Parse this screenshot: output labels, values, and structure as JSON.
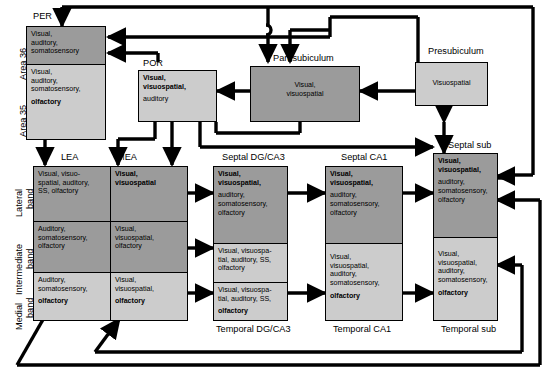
{
  "diagram": {
    "title_regions": {
      "per": "PER",
      "por": "POR",
      "parasubiculum": "Parasubiculum",
      "presubiculum": "Presubiculum",
      "septal_sub": "Septal sub",
      "lea": "LEA",
      "mea": "MEA",
      "septal_dg_ca3": "Septal DG/CA3",
      "septal_ca1": "Septal CA1",
      "temporal_dg_ca3": "Temporal DG/CA3",
      "temporal_ca1": "Temporal CA1",
      "temporal_sub": "Temporal sub"
    },
    "side_labels": {
      "area36": "Area 36",
      "area35": "Area 35",
      "lateral_band": "Lateral\nband",
      "lateral_band_line1": "Lateral",
      "lateral_band_line2": "band",
      "intermediate_band_line1": "Intermediate",
      "intermediate_band_line2": "band",
      "medial_band_line1": "Medial",
      "medial_band_line2": "band"
    },
    "boxes": {
      "area36": {
        "normal": "Visual,\nauditory,\nsomatosensory",
        "bold": "",
        "shade": "dark"
      },
      "area35": {
        "normal": "Visual,\nauditory,\nsomatosensory,",
        "bold": "olfactory",
        "shade": "light"
      },
      "por": {
        "bold": "Visual,\nvisuospatial,",
        "normal": "auditory",
        "shade": "light"
      },
      "parasubiculum": {
        "normal": "Visual,\nvisuospatial",
        "bold": "",
        "shade": "dark"
      },
      "presubiculum": {
        "normal": "Visuospatial",
        "bold": "",
        "shade": "light"
      },
      "lea_lateral": {
        "normal": "Visual, visuo-\nspatial, auditory,\nSS, olfactory",
        "bold": "",
        "shade": "dark"
      },
      "lea_intermediate": {
        "normal": "Auditory,\nsomatosensory,\nolfactory",
        "bold": "",
        "shade": "dark"
      },
      "lea_medial": {
        "normal": "Auditory,\nsomatosensory,",
        "bold": "olfactory",
        "shade": "light"
      },
      "mea_lateral": {
        "bold": "Visual,\nvisuospatial",
        "normal": "",
        "shade": "dark"
      },
      "mea_intermediate": {
        "normal": "Visual,\nvisuospatial,\nolfactory",
        "bold": "",
        "shade": "dark"
      },
      "mea_medial": {
        "normal": "Visual,\nvisuospatial,",
        "bold": "olfactory",
        "shade": "light"
      },
      "septal_dg_ca3": {
        "bold": "Visual,\nvisuospatial,",
        "normal": "auditory,\nsomatosensory,\nolfactory",
        "shade": "dark"
      },
      "mid_dg_ca3": {
        "normal": "Visual, visuospa-\ntial, auditory, SS,\nolfactory",
        "bold": "",
        "shade": "light"
      },
      "temporal_dg_ca3": {
        "normal": "Visual, visuospa-\ntial, auditory, SS,",
        "bold": "olfactory",
        "shade": "light"
      },
      "septal_ca1": {
        "bold": "Visual,\nvisuospatial,",
        "normal": "auditory,\nsomatosensory,\nolfactory",
        "shade": "dark"
      },
      "temporal_ca1": {
        "normal": "Visual,\nvisuospatial,\nauditory,\nsomatosensory,",
        "bold": "olfactory",
        "shade": "light"
      },
      "septal_sub": {
        "bold": "Visual,\nvisuospatial,",
        "normal": "auditory,\nsomatosensory,\nolfactory",
        "shade": "dark"
      },
      "temporal_sub": {
        "normal": "Visual,\nvisuospatial,\nauditory,\nsomatosensory,",
        "bold": "olfactory",
        "shade": "light"
      }
    },
    "colors": {
      "dark_fill": "#9b9b9b",
      "light_fill": "#cccccc",
      "stroke": "#000000",
      "background": "#ffffff"
    }
  }
}
